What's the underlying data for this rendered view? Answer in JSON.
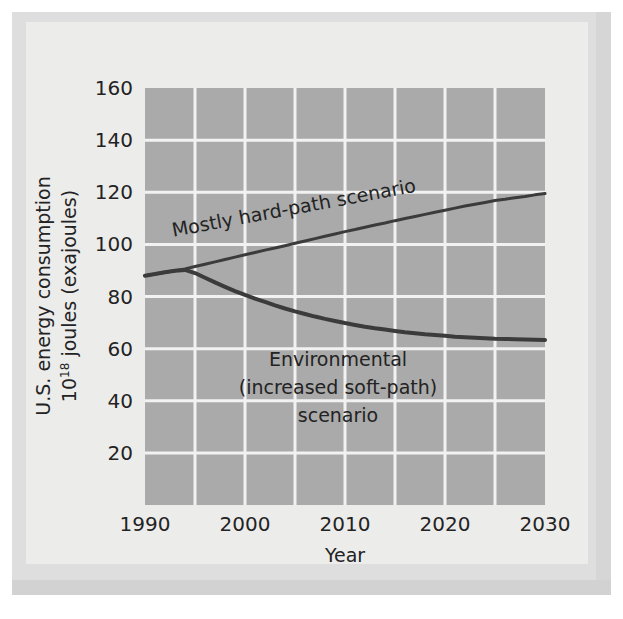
{
  "figure": {
    "background_color": "#ececeb",
    "plate_color": "#dedede",
    "plot_area_color": "#aaaaaa",
    "gridline_color": "#f2f2f2",
    "line_color": "#3b3b3b",
    "text_color": "#232323"
  },
  "axes": {
    "y_title_line1": "U.S. energy consumption",
    "y_title_line2_prefix": "10",
    "y_title_line2_sup": "18",
    "y_title_line2_suffix": " joules (exajoules)",
    "x_title": "Year",
    "y_ticks": [
      20,
      40,
      60,
      80,
      100,
      120,
      140,
      160
    ],
    "y_tick_labels": [
      "20",
      "40",
      "60",
      "80",
      "100",
      "120",
      "140",
      "160"
    ],
    "x_ticks": [
      1990,
      2000,
      2010,
      2020,
      2030
    ],
    "x_tick_labels": [
      "1990",
      "2000",
      "2010",
      "2020",
      "2030"
    ],
    "x_gridlines": [
      1995,
      2000,
      2005,
      2010,
      2015,
      2020,
      2025
    ],
    "y_gridlines": [
      20,
      40,
      60,
      80,
      100,
      120,
      140
    ],
    "ylim": [
      0,
      160
    ],
    "xlim": [
      1990,
      2030
    ]
  },
  "annotations": {
    "hard_path": {
      "text": "Mostly hard-path scenario",
      "rotation_deg": -10.5
    },
    "environmental": {
      "line1": "Environmental",
      "line2": "(increased soft-path)",
      "line3": "scenario"
    }
  },
  "chart_data": {
    "type": "line",
    "title": "",
    "xlabel": "Year",
    "ylabel": "U.S. energy consumption 10^18 joules (exajoules)",
    "xlim": [
      1990,
      2030
    ],
    "ylim": [
      0,
      160
    ],
    "grid": true,
    "legend": "inline-annotations",
    "x": [
      1990,
      1991,
      1992,
      1993,
      1994,
      1995,
      1996,
      1997,
      1998,
      1999,
      2000,
      2001,
      2002,
      2003,
      2004,
      2005,
      2006,
      2007,
      2008,
      2009,
      2010,
      2011,
      2012,
      2013,
      2014,
      2015,
      2016,
      2017,
      2018,
      2019,
      2020,
      2021,
      2022,
      2023,
      2024,
      2025,
      2026,
      2027,
      2028,
      2029,
      2030
    ],
    "series": [
      {
        "name": "Mostly hard-path scenario",
        "color": "#3b3b3b",
        "values": [
          88.0,
          88.6,
          89.3,
          89.9,
          90.6,
          91.5,
          92.4,
          93.3,
          94.2,
          95.1,
          96.0,
          96.9,
          97.8,
          98.6,
          99.5,
          100.4,
          101.3,
          102.2,
          103.1,
          104.0,
          104.9,
          105.7,
          106.6,
          107.4,
          108.2,
          109.1,
          109.9,
          110.7,
          111.5,
          112.3,
          113.1,
          113.9,
          114.7,
          115.4,
          116.1,
          116.8,
          117.3,
          117.9,
          118.4,
          119.0,
          119.5
        ]
      },
      {
        "name": "Environmental (increased soft-path) scenario",
        "color": "#3b3b3b",
        "values": [
          88.0,
          88.6,
          89.3,
          89.9,
          90.2,
          89.0,
          87.2,
          85.4,
          83.7,
          82.1,
          80.6,
          79.2,
          77.9,
          76.6,
          75.4,
          74.3,
          73.3,
          72.3,
          71.4,
          70.6,
          69.8,
          69.1,
          68.4,
          67.8,
          67.3,
          66.8,
          66.3,
          65.9,
          65.5,
          65.2,
          64.9,
          64.6,
          64.4,
          64.2,
          64.0,
          63.8,
          63.7,
          63.6,
          63.5,
          63.4,
          63.3
        ]
      }
    ]
  }
}
